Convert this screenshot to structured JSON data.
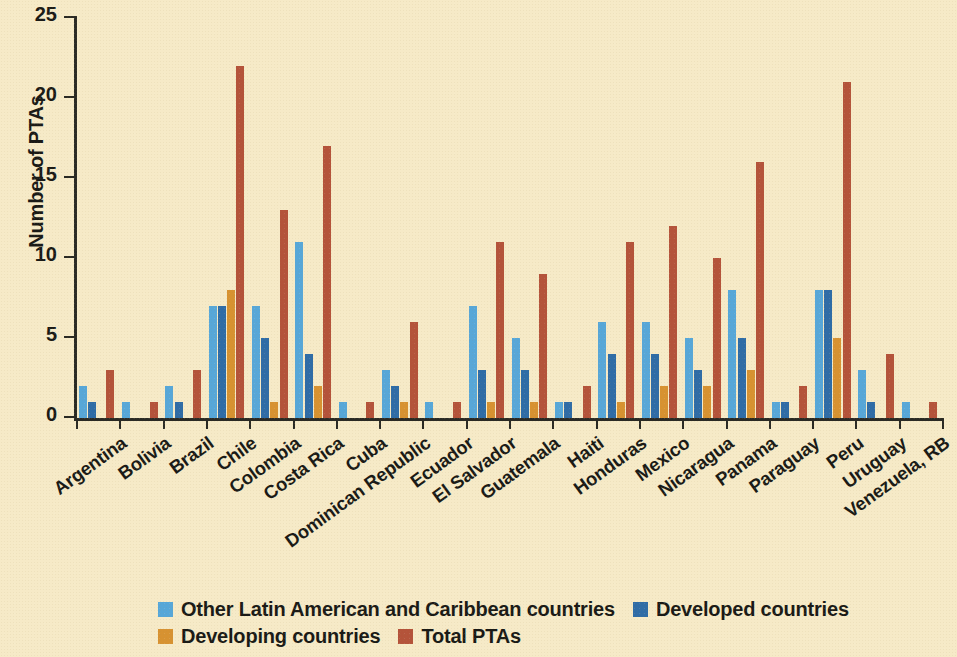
{
  "chart_data": {
    "type": "bar",
    "title": "",
    "xlabel": "",
    "ylabel": "Number of PTAs",
    "ylim": [
      0,
      25
    ],
    "yticks": [
      0,
      5,
      10,
      15,
      20,
      25
    ],
    "grid": false,
    "legend_position": "bottom",
    "categories": [
      "Argentina",
      "Bolivia",
      "Brazil",
      "Chile",
      "Colombia",
      "Costa Rica",
      "Cuba",
      "Dominican Republic",
      "Ecuador",
      "El Salvador",
      "Guatemala",
      "Haiti",
      "Honduras",
      "Mexico",
      "Nicaragua",
      "Panama",
      "Paraguay",
      "Peru",
      "Uruguay",
      "Venezuela, RB"
    ],
    "series": [
      {
        "name": "Other Latin American and Caribbean countries",
        "color": "#57a7d8",
        "values": [
          2,
          1,
          2,
          7,
          7,
          11,
          1,
          3,
          1,
          7,
          5,
          1,
          6,
          6,
          5,
          8,
          1,
          8,
          3,
          1
        ]
      },
      {
        "name": "Developed countries",
        "color": "#2f6ca6",
        "values": [
          1,
          0,
          1,
          7,
          5,
          4,
          0,
          2,
          0,
          3,
          3,
          1,
          4,
          4,
          3,
          5,
          1,
          8,
          1,
          0
        ]
      },
      {
        "name": "Developing countries",
        "color": "#d79231",
        "values": [
          0,
          0,
          0,
          8,
          1,
          2,
          0,
          1,
          0,
          1,
          1,
          0,
          1,
          2,
          2,
          3,
          0,
          5,
          0,
          0
        ]
      },
      {
        "name": "Total PTAs",
        "color": "#b4533a",
        "values": [
          3,
          1,
          3,
          22,
          13,
          17,
          1,
          6,
          1,
          11,
          9,
          2,
          11,
          12,
          10,
          16,
          2,
          21,
          4,
          1
        ]
      }
    ]
  },
  "colors": {
    "background": "#f6eac7",
    "axis": "#2a2a24",
    "text": "#1a1a16"
  }
}
